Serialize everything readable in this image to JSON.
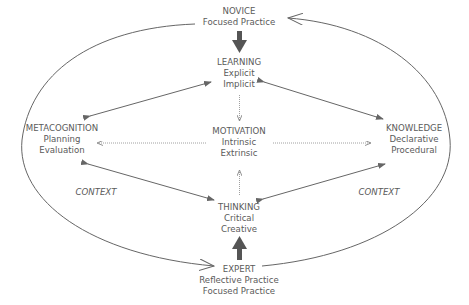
{
  "diagram": {
    "nodes": {
      "novice": {
        "title": "NOVICE",
        "lines": [
          "Focused Practice"
        ]
      },
      "learning": {
        "title": "LEARNING",
        "lines": [
          "Explicit",
          "Implicit"
        ]
      },
      "metacognition": {
        "title": "METACOGNITION",
        "lines": [
          "Planning",
          "Evaluation"
        ]
      },
      "motivation": {
        "title": "MOTIVATION",
        "lines": [
          "Intrinsic",
          "Extrinsic"
        ]
      },
      "knowledge": {
        "title": "KNOWLEDGE",
        "lines": [
          "Declarative",
          "Procedural"
        ]
      },
      "thinking": {
        "title": "THINKING",
        "lines": [
          "Critical",
          "Creative"
        ]
      },
      "expert": {
        "title": "EXPERT",
        "lines": [
          "Reflective Practice",
          "Focused Practice"
        ]
      }
    },
    "context_labels": [
      "CONTEXT",
      "CONTEXT"
    ],
    "edges": [
      {
        "from": "NOVICE",
        "to": "LEARNING",
        "style": "bold-arrow"
      },
      {
        "from": "LEARNING",
        "to": "METACOGNITION",
        "style": "double-arrow"
      },
      {
        "from": "LEARNING",
        "to": "KNOWLEDGE",
        "style": "double-arrow"
      },
      {
        "from": "LEARNING",
        "to": "MOTIVATION",
        "style": "dotted-arrow"
      },
      {
        "from": "MOTIVATION",
        "to": "METACOGNITION",
        "style": "dotted-arrow"
      },
      {
        "from": "MOTIVATION",
        "to": "KNOWLEDGE",
        "style": "dotted-arrow"
      },
      {
        "from": "THINKING",
        "to": "MOTIVATION",
        "style": "dotted-arrow"
      },
      {
        "from": "THINKING",
        "to": "METACOGNITION",
        "style": "double-arrow"
      },
      {
        "from": "THINKING",
        "to": "KNOWLEDGE",
        "style": "double-arrow"
      },
      {
        "from": "EXPERT",
        "to": "THINKING",
        "style": "bold-arrow"
      },
      {
        "from": "NOVICE",
        "to": "EXPERT",
        "style": "outer-arc-left"
      },
      {
        "from": "EXPERT",
        "to": "NOVICE",
        "style": "outer-arc-right"
      }
    ],
    "colors": {
      "line": "#666666",
      "text": "#5a5a5a",
      "bold_arrow": "#555555"
    }
  }
}
